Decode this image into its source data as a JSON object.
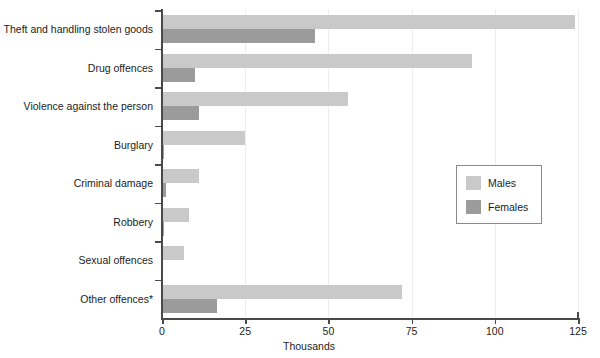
{
  "chart_data": {
    "type": "bar",
    "orientation": "horizontal",
    "title": "",
    "xlabel": "Thousands",
    "ylabel": "",
    "xlim": [
      0,
      125
    ],
    "xticks": [
      0,
      25,
      50,
      75,
      100,
      125
    ],
    "xtick_labels": [
      "0",
      "25",
      "50",
      "75",
      "100",
      "125"
    ],
    "grid": true,
    "grid_axis": "x",
    "legend_position": "center-right",
    "categories": [
      "Theft and handling stolen goods",
      "Drug offences",
      "Violence against the person",
      "Burglary",
      "Criminal damage",
      "Robbery",
      "Sexual offences",
      "Other offences*"
    ],
    "series": [
      {
        "name": "Males",
        "color": "#c9c9c9",
        "values": [
          124,
          93,
          56,
          25,
          11,
          8,
          6.5,
          72
        ]
      },
      {
        "name": "Females",
        "color": "#9b9b9b",
        "values": [
          46,
          10,
          11,
          0.7,
          1.2,
          0.6,
          0.1,
          16.5
        ]
      }
    ]
  },
  "legend": {
    "entries": [
      {
        "label": "Males",
        "color": "#c9c9c9"
      },
      {
        "label": "Females",
        "color": "#9b9b9b"
      }
    ]
  },
  "axis": {
    "x_title": "Thousands"
  }
}
